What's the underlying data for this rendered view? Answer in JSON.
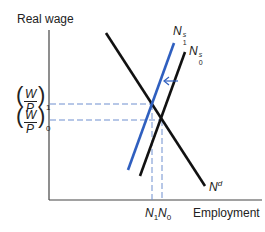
{
  "diagram": {
    "y_axis_label": "Real wage",
    "x_axis_label": "Employment",
    "y_ticks": [
      {
        "num": "W",
        "den": "P",
        "sub": "1"
      },
      {
        "num": "W",
        "den": "P",
        "sub": "0"
      }
    ],
    "x_ticks": [
      {
        "base": "N",
        "sub": "1"
      },
      {
        "base": "N",
        "sub": "0"
      }
    ],
    "curves": [
      {
        "name": "N",
        "sup": "d",
        "sub": "",
        "color": "#111111"
      },
      {
        "name": "N",
        "sup": "s",
        "sub": "0",
        "color": "#111111"
      },
      {
        "name": "N",
        "sup": "s",
        "sub": "1",
        "color": "#2f5fbf"
      }
    ],
    "colors": {
      "axis": "#444444",
      "demand": "#111111",
      "supply0": "#111111",
      "supply1": "#2f5fbf",
      "dashed": "#6f8fcf"
    }
  }
}
